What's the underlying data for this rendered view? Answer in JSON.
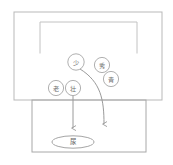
{
  "diagram": {
    "title": "",
    "colors": {
      "outer_frame_stroke": "#b9b9b9",
      "inner_bracket_stroke": "#c2c2c2",
      "lower_frame_stroke": "#a8a8a8",
      "node_circle_stroke": "#b0b0b0",
      "arrow_stroke": "#9a9a9a",
      "ellipse_stroke": "#a5a5a5",
      "label_text": "#6d6d6d",
      "background": "#ffffff"
    },
    "frames": {
      "outer": {
        "x": 14,
        "y": 12,
        "width": 148,
        "height": 88
      },
      "inner_bracket": {
        "x": 40,
        "y": 22,
        "width": 97,
        "height": 31
      },
      "lower": {
        "x": 32,
        "y": 100,
        "width": 114,
        "height": 52
      }
    },
    "nodes": [
      {
        "id": "node-shao",
        "label": "少",
        "cx": 76,
        "cy": 62,
        "r": 8.2
      },
      {
        "id": "node-xiu",
        "label": "秀",
        "cx": 102,
        "cy": 65,
        "r": 7.6
      },
      {
        "id": "node-qing",
        "label": "青",
        "cx": 111,
        "cy": 79,
        "r": 7.6
      },
      {
        "id": "node-lao",
        "label": "老",
        "cx": 56,
        "cy": 88,
        "r": 7.6
      },
      {
        "id": "node-zhuang",
        "label": "壮",
        "cx": 73,
        "cy": 88,
        "r": 7.6
      }
    ],
    "outlet": {
      "id": "outlet-niao",
      "label": "尿",
      "cx": 73,
      "cy": 142,
      "rx": 21,
      "ry": 6.2
    },
    "arrows": [
      {
        "id": "arrow-straight-left",
        "kind": "straight",
        "from": {
          "x": 73,
          "y": 96
        },
        "to": {
          "x": 73,
          "y": 128
        }
      },
      {
        "id": "arrow-curved-right",
        "kind": "curved",
        "from": {
          "x": 80,
          "y": 69
        },
        "control1": {
          "x": 101,
          "y": 82
        },
        "control2": {
          "x": 104,
          "y": 100
        },
        "to": {
          "x": 104,
          "y": 124
        }
      }
    ]
  }
}
